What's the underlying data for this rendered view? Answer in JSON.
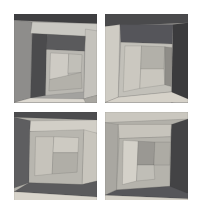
{
  "artwork": {
    "title": "Four Panel Nested Quadrilateral Composition",
    "background_color": "#ffffff",
    "canvas": {
      "width": 201,
      "height": 218
    },
    "grid": {
      "rows": 2,
      "columns": 2,
      "column_gap": 8,
      "row_gap": 9
    },
    "panels": [
      {
        "id": "panel-top-left",
        "label": "Top Left Panel",
        "viewbox": "0 0 100 100",
        "background_color": "#9a9a98",
        "shapes": [
          {
            "name": "base-field",
            "points": "0,0 100,0 100,100 0,100",
            "fill": "#a3a29f"
          },
          {
            "name": "top-dark-band",
            "points": "0,0 100,0 100,11 0,7",
            "fill": "#3f3f41"
          },
          {
            "name": "left-mid-gray",
            "points": "0,7 22,9 20,95 0,100",
            "fill": "#8e8d8b"
          },
          {
            "name": "upper-light-band",
            "points": "22,9 100,11 100,26 20,22",
            "fill": "#c9c8c2"
          },
          {
            "name": "right-light-col",
            "points": "86,17 100,19 100,92 84,96",
            "fill": "#c4c2bc"
          },
          {
            "name": "dark-left-column",
            "points": "22,22 40,23 38,92 20,95",
            "fill": "#4b4b4d"
          },
          {
            "name": "inner-dark-top",
            "points": "40,23 86,25 85,42 39,40",
            "fill": "#5a5a5c"
          },
          {
            "name": "inner-field",
            "points": "39,40 85,42 84,88 38,92",
            "fill": "#b9b7b1"
          },
          {
            "name": "inner-pale-left",
            "points": "44,44 66,45 65,72 43,74",
            "fill": "#cecbc4"
          },
          {
            "name": "inner-pale-right",
            "points": "66,45 82,46 81,66 65,67",
            "fill": "#c1bfb8"
          },
          {
            "name": "inner-mid-low",
            "points": "43,74 81,66 82,84 42,87",
            "fill": "#b3b1aa"
          },
          {
            "name": "bottom-pale-strip",
            "points": "20,95 84,96 100,92 100,100 0,100",
            "fill": "#ddd9d1"
          },
          {
            "name": "bottom-right-wedge",
            "points": "84,96 100,92 100,100 86,100",
            "fill": "#a8a6a0"
          }
        ]
      },
      {
        "id": "panel-top-right",
        "label": "Top Right Panel",
        "viewbox": "0 0 100 100",
        "background_color": "#a0a09d",
        "shapes": [
          {
            "name": "base-field",
            "points": "0,0 100,0 100,100 0,100",
            "fill": "#adaba6"
          },
          {
            "name": "top-dark-band",
            "points": "0,0 100,0 100,10 0,14",
            "fill": "#4a4a4c"
          },
          {
            "name": "left-pale-col",
            "points": "0,14 18,12 16,94 0,100",
            "fill": "#cfccc4"
          },
          {
            "name": "right-dark-col",
            "points": "82,12 100,10 100,96 80,100",
            "fill": "#3b3b3d"
          },
          {
            "name": "upper-dark-block",
            "points": "18,12 82,12 81,34 19,32",
            "fill": "#55555a"
          },
          {
            "name": "mid-light-block",
            "points": "19,32 81,34 80,88 16,94",
            "fill": "#c2c0b9"
          },
          {
            "name": "left-pale-inner",
            "points": "24,36 44,36 42,84 22,88",
            "fill": "#cbc8c0"
          },
          {
            "name": "center-mid-block",
            "points": "44,36 72,37 71,62 43,62",
            "fill": "#b2b0a9"
          },
          {
            "name": "center-pale-block",
            "points": "43,62 71,62 72,80 42,84",
            "fill": "#c9c6be"
          },
          {
            "name": "right-inner-gray",
            "points": "72,37 81,38 80,82 72,80",
            "fill": "#8f8d88"
          },
          {
            "name": "bottom-pale-strip",
            "points": "16,94 80,88 100,96 100,100 0,100",
            "fill": "#d6d2c9"
          }
        ]
      },
      {
        "id": "panel-bottom-left",
        "label": "Bottom Left Panel",
        "viewbox": "0 0 100 100",
        "background_color": "#a5a4a0",
        "shapes": [
          {
            "name": "base-field",
            "points": "0,0 100,0 100,100 0,100",
            "fill": "#b4b2ab"
          },
          {
            "name": "top-dark-band",
            "points": "0,0 100,0 100,9 0,6",
            "fill": "#4c4c4e"
          },
          {
            "name": "left-dark-col",
            "points": "0,6 20,10 18,80 0,86",
            "fill": "#5e5e60"
          },
          {
            "name": "upper-pale-band",
            "points": "20,10 100,9 100,24 19,22",
            "fill": "#d2cfc7"
          },
          {
            "name": "right-pale-col",
            "points": "84,20 100,24 100,78 82,82",
            "fill": "#c8c5bd"
          },
          {
            "name": "inner-mid-field",
            "points": "19,22 84,20 82,82 18,80",
            "fill": "#b8b6af"
          },
          {
            "name": "inner-left-pale",
            "points": "26,28 48,28 46,70 25,72",
            "fill": "#c6c3bb"
          },
          {
            "name": "inner-top-light",
            "points": "48,28 78,29 77,46 47,46",
            "fill": "#cdcac2"
          },
          {
            "name": "inner-center-gray",
            "points": "47,46 77,46 76,68 46,70",
            "fill": "#b0aea7"
          },
          {
            "name": "bottom-dark-band",
            "points": "18,80 82,82 100,78 100,96 0,90",
            "fill": "#5b5b5d"
          },
          {
            "name": "bottom-pale-strip",
            "points": "0,90 100,96 100,100 0,100",
            "fill": "#d8d4cb"
          }
        ]
      },
      {
        "id": "panel-bottom-right",
        "label": "Bottom Right Panel",
        "viewbox": "0 0 100 100",
        "background_color": "#a2a19d",
        "shapes": [
          {
            "name": "base-field",
            "points": "0,0 100,0 100,100 0,100",
            "fill": "#b2b0a9"
          },
          {
            "name": "top-pale-band",
            "points": "0,0 100,0 100,8 0,12",
            "fill": "#cac7bf"
          },
          {
            "name": "left-mid-col",
            "points": "0,12 16,14 14,88 0,94",
            "fill": "#a9a7a1"
          },
          {
            "name": "right-dark-col",
            "points": "80,14 100,8 100,92 78,96",
            "fill": "#434345"
          },
          {
            "name": "upper-light-band",
            "points": "16,14 80,14 79,28 17,30",
            "fill": "#c7c4bc"
          },
          {
            "name": "inner-field",
            "points": "17,30 79,28 78,84 14,88",
            "fill": "#b5b3ac"
          },
          {
            "name": "inner-pale-left",
            "points": "22,32 40,33 38,78 21,82",
            "fill": "#d4d1c9"
          },
          {
            "name": "inner-gray-mid",
            "points": "40,33 60,34 59,60 39,60",
            "fill": "#9a9893"
          },
          {
            "name": "inner-pale-center",
            "points": "39,60 59,60 60,76 38,78",
            "fill": "#c0beb7"
          },
          {
            "name": "inner-right-gray",
            "points": "60,34 79,34 78,60 59,60",
            "fill": "#adaba4"
          },
          {
            "name": "bottom-dark-band",
            "points": "14,88 78,84 100,92 100,98 0,94",
            "fill": "#56565a"
          },
          {
            "name": "bottom-pale-strip",
            "points": "0,94 100,98 100,100 0,100",
            "fill": "#d5d1c8"
          }
        ]
      }
    ]
  }
}
